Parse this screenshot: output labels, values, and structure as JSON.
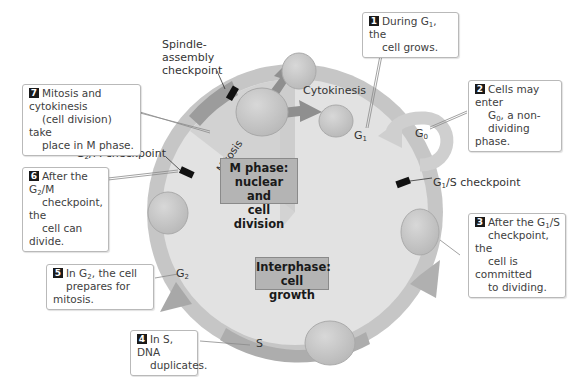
{
  "diagram": {
    "center_labels": {
      "m_phase": [
        "M phase:",
        "nuclear and",
        "cell division"
      ],
      "interphase": [
        "Interphase:",
        "cell growth"
      ]
    },
    "ring_labels": {
      "mitosis": "Mitosis",
      "g1": "G",
      "g1_sub": "1",
      "g0": "G",
      "g0_sub": "0",
      "g2": "G",
      "g2_sub": "2",
      "s": "S",
      "cytokinesis": "Cytokinesis"
    },
    "checkpoints": {
      "spindle": [
        "Spindle-",
        "assembly",
        "checkpoint"
      ],
      "g2m_pre": "G",
      "g2m_sub": "2",
      "g2m_post": "/M checkpoint",
      "g1s_pre": "G",
      "g1s_sub": "1",
      "g1s_post": "/S checkpoint"
    },
    "callouts": [
      {
        "num": "1",
        "lines": [
          "During G",
          "1",
          ", the",
          "cell grows."
        ]
      },
      {
        "num": "2",
        "lines": [
          "Cells may enter",
          "G",
          "0",
          ", a non-",
          "dividing phase."
        ]
      },
      {
        "num": "3",
        "lines": [
          "After the G",
          "1",
          "/S",
          "checkpoint, the",
          "cell is committed",
          "to dividing."
        ]
      },
      {
        "num": "4",
        "lines": [
          "In S, DNA",
          "duplicates."
        ]
      },
      {
        "num": "5",
        "lines": [
          "In G",
          "2",
          ", the cell",
          "prepares for mitosis."
        ]
      },
      {
        "num": "6",
        "lines": [
          "After the G",
          "2",
          "/M",
          "checkpoint, the",
          "cell can divide."
        ]
      },
      {
        "num": "7",
        "lines": [
          "Mitosis and cytokinesis",
          "(cell division) take",
          "place in M phase."
        ]
      }
    ],
    "colors": {
      "ring": "#bcbcbc",
      "ring_dark": "#a8a8a8",
      "inner": "#dedede",
      "wedge": "#cfcfcf",
      "cell": "#c4c4c4",
      "checkpoint": "#111111",
      "arrow": "#9a9a9a"
    }
  }
}
